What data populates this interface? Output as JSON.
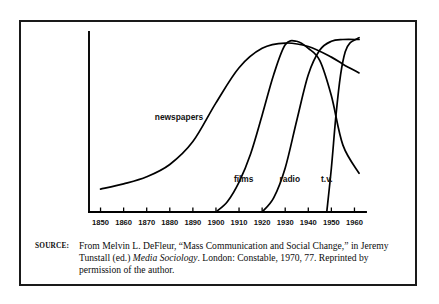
{
  "figure": {
    "source_label": "SOURCE:",
    "caption_part1": "From Melvin L. DeFleur, “Mass Communication and Social Change,” in Jeremy Tunstall (ed.) ",
    "caption_italic": "Media Sociology",
    "caption_part2": ". London: Constable, 1970, 77. Reprinted by permission of the author."
  },
  "chart_data": {
    "type": "line",
    "title": "",
    "xlabel": "",
    "ylabel": "",
    "xlim": [
      1845,
      1965
    ],
    "ylim": [
      0,
      100
    ],
    "grid": false,
    "legend": "inline-labels",
    "tick_labels": [
      "1850",
      "1860",
      "1870",
      "1880",
      "1890",
      "1900",
      "1910",
      "1920",
      "1930",
      "1940",
      "1950",
      "1960"
    ],
    "x_ticks": [
      1850,
      1860,
      1870,
      1880,
      1890,
      1900,
      1910,
      1920,
      1930,
      1940,
      1950,
      1960
    ],
    "series": [
      {
        "name": "newspapers",
        "label": "newspapers",
        "label_x": 1884,
        "label_y": 52,
        "x": [
          1850,
          1860,
          1870,
          1880,
          1890,
          1900,
          1910,
          1920,
          1930,
          1940,
          1950,
          1955,
          1962
        ],
        "values": [
          13,
          16,
          20,
          27,
          40,
          62,
          82,
          93,
          96,
          94,
          88,
          84,
          79
        ]
      },
      {
        "name": "films",
        "label": "films",
        "label_x": 1912,
        "label_y": 17,
        "x": [
          1900,
          1905,
          1910,
          1915,
          1920,
          1925,
          1930,
          1935,
          1940,
          1945,
          1950,
          1955,
          1962
        ],
        "values": [
          0,
          6,
          17,
          33,
          55,
          78,
          95,
          97,
          93,
          86,
          66,
          38,
          22
        ]
      },
      {
        "name": "radio",
        "label": "radio",
        "label_x": 1932,
        "label_y": 17,
        "x": [
          1920,
          1925,
          1930,
          1935,
          1940,
          1945,
          1950,
          1955,
          1962
        ],
        "values": [
          0,
          8,
          25,
          52,
          78,
          92,
          97,
          98,
          98
        ]
      },
      {
        "name": "t.v.",
        "label": "t.v.",
        "label_x": 1948,
        "label_y": 17,
        "x": [
          1948,
          1950,
          1952,
          1954,
          1956,
          1958,
          1962
        ],
        "values": [
          0,
          25,
          55,
          78,
          91,
          96,
          99
        ]
      }
    ]
  }
}
